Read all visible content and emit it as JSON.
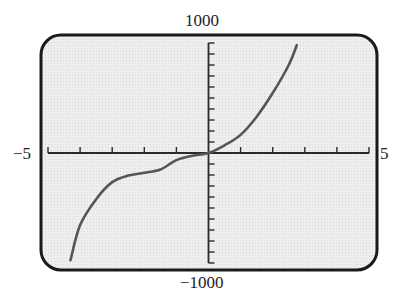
{
  "chart_data": {
    "type": "line",
    "title": "",
    "xlabel": "",
    "ylabel": "",
    "xlim": [
      -5,
      5
    ],
    "ylim": [
      -1000,
      1000
    ],
    "x_tick_step": 1,
    "y_tick_step": 100,
    "grid": false,
    "legend": null,
    "window_labels": {
      "xmin": "−5",
      "xmax": "5",
      "ymin": "−1000",
      "ymax": "1000"
    },
    "series": [
      {
        "name": "f(x)",
        "x": [
          -4.3,
          -4,
          -3.5,
          -3,
          -2.5,
          -2,
          -1.5,
          -1,
          -0.5,
          0,
          0.5,
          1,
          1.5,
          2,
          2.5,
          2.75
        ],
        "y": [
          -975,
          -655,
          -420,
          -265,
          -205,
          -180,
          -150,
          -65,
          -25,
          0,
          70,
          165,
          330,
          545,
          800,
          980
        ]
      }
    ]
  },
  "colors": {
    "screen_background": "#ececec",
    "frame": "#1a1a1a",
    "axes": "#2a2a2a",
    "curve": "#555555"
  }
}
